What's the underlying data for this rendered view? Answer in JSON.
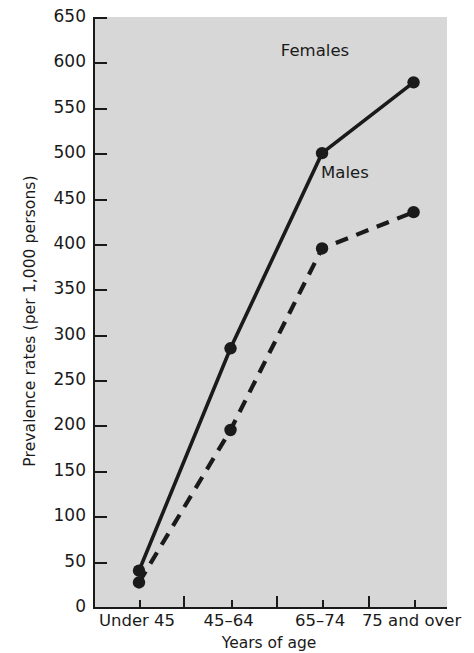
{
  "chart_data": {
    "type": "line",
    "title": "",
    "xlabel": "Years of age",
    "ylabel": "Prevalence rates (per 1,000 persons)",
    "categories": [
      "Under 45",
      "45–64",
      "65–74",
      "75 and over"
    ],
    "ylim": [
      0,
      650
    ],
    "yticks": [
      0,
      50,
      100,
      150,
      200,
      250,
      300,
      350,
      400,
      450,
      500,
      550,
      600,
      650
    ],
    "ytick_labels": [
      "0",
      "50",
      "100",
      "150",
      "200",
      "250",
      "300",
      "350",
      "400",
      "450",
      "500",
      "550",
      "600",
      "650"
    ],
    "grid": false,
    "legend_position": "inline-annotations",
    "plot_background": "#d7d7d7",
    "series": [
      {
        "name": "Females",
        "label": "Females",
        "values": [
          40,
          285,
          500,
          578
        ],
        "line_style": "solid",
        "color": "#1a1a1a",
        "marker": "circle"
      },
      {
        "name": "Males",
        "label": "Males",
        "values": [
          27,
          195,
          395,
          435
        ],
        "line_style": "dashed",
        "color": "#1a1a1a",
        "marker": "circle"
      }
    ],
    "annotations": [
      {
        "text": "Females",
        "x_frac": 0.625,
        "y_value": 612
      },
      {
        "text": "Males",
        "x_frac": 0.71,
        "y_value": 478
      }
    ]
  }
}
